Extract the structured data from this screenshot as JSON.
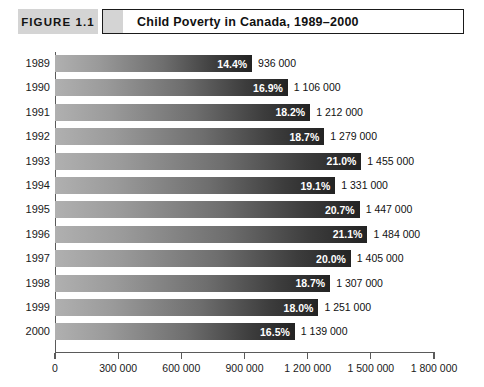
{
  "header": {
    "figure_tag": "FIGURE 1.1",
    "title": "Child Poverty in Canada, 1989–2000"
  },
  "chart_data": {
    "type": "bar",
    "orientation": "horizontal",
    "title": "Child Poverty in Canada, 1989–2000",
    "xlabel": "",
    "ylabel": "",
    "xlim": [
      0,
      1800000
    ],
    "grid": false,
    "legend": null,
    "categories": [
      "1989",
      "1990",
      "1991",
      "1992",
      "1993",
      "1994",
      "1995",
      "1996",
      "1997",
      "1998",
      "1999",
      "2000"
    ],
    "values": [
      936000,
      1106000,
      1212000,
      1279000,
      1455000,
      1331000,
      1447000,
      1484000,
      1405000,
      1307000,
      1251000,
      1139000
    ],
    "data_labels_inside": [
      "14.4%",
      "16.9%",
      "18.2%",
      "18.7%",
      "21.0%",
      "19.1%",
      "20.7%",
      "21.1%",
      "20.0%",
      "18.7%",
      "18.0%",
      "16.5%"
    ],
    "data_labels_outside": [
      "936 000",
      "1 106 000",
      "1 212 000",
      "1 279 000",
      "1 455 000",
      "1 331 000",
      "1 447 000",
      "1 484 000",
      "1 405 000",
      "1 307 000",
      "1 251 000",
      "1 139 000"
    ],
    "percent_values": [
      14.4,
      16.9,
      18.2,
      18.7,
      21.0,
      19.1,
      20.7,
      21.1,
      20.0,
      18.7,
      18.0,
      16.5
    ],
    "xticks": [
      0,
      300000,
      600000,
      900000,
      1200000,
      1500000,
      1800000
    ],
    "xticklabels": [
      "0",
      "300 000",
      "600 000",
      "900 000",
      "1 200 000",
      "1 500 000",
      "1 800 000"
    ],
    "bar_color_start": "#b0b0b0",
    "bar_color_end": "#232323",
    "axis_color": "#5a5a5a"
  }
}
